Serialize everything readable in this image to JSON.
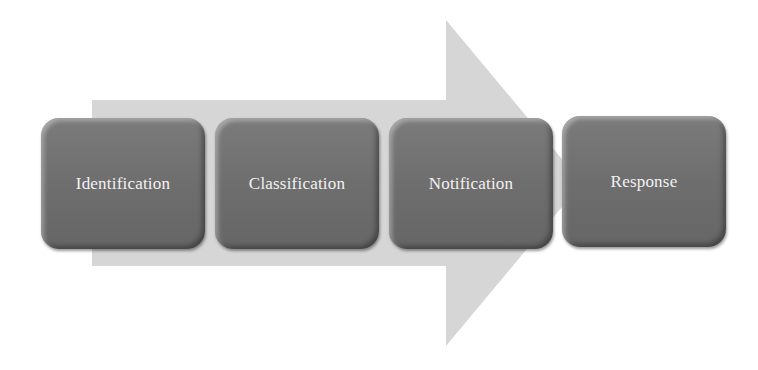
{
  "diagram": {
    "type": "process-arrow",
    "colors": {
      "arrow": "#d8d8d8",
      "box": "#727272",
      "text": "#f2f2f2",
      "background": "#ffffff"
    },
    "steps": [
      {
        "label": "Identification"
      },
      {
        "label": "Classification"
      },
      {
        "label": "Notification"
      },
      {
        "label": "Response"
      }
    ]
  }
}
